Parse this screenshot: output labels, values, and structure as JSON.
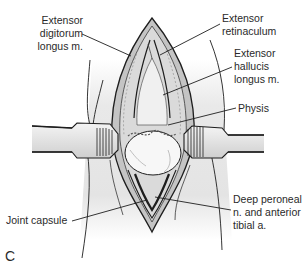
{
  "figure": {
    "panel_letter": "C",
    "labels": [
      {
        "id": "edl",
        "text": "Extensor\ndigitorum\nlongus m.",
        "x": 35,
        "y": 14,
        "align": "right",
        "anchor": [
          131,
          56
        ]
      },
      {
        "id": "retinaculum",
        "text": "Extensor\nretinaculum",
        "x": 222,
        "y": 12,
        "align": "left",
        "anchor": [
          160,
          55
        ]
      },
      {
        "id": "ehl",
        "text": "Extensor\nhallucis\nlongus m.",
        "x": 234,
        "y": 47,
        "align": "left",
        "anchor": [
          163,
          89
        ]
      },
      {
        "id": "physis",
        "text": "Physis",
        "x": 238,
        "y": 103,
        "align": "left",
        "anchor": [
          168,
          125
        ]
      },
      {
        "id": "joint-capsule",
        "text": "Joint capsule",
        "x": 6,
        "y": 215,
        "align": "left",
        "anchor": [
          147,
          200
        ]
      },
      {
        "id": "deep-peroneal",
        "text": "Deep peroneal\nn. and anterior\ntibial a.",
        "x": 233,
        "y": 193,
        "align": "left",
        "anchor": [
          155,
          197
        ]
      }
    ],
    "colors": {
      "background": "#ffffff",
      "line": "#1e1e1e",
      "text": "#2a2a2a",
      "skin": "#e6e6e6",
      "muscle": "#b9b9b9",
      "bone": "#f2f2f2",
      "retractor": "#dcdcdc"
    }
  }
}
